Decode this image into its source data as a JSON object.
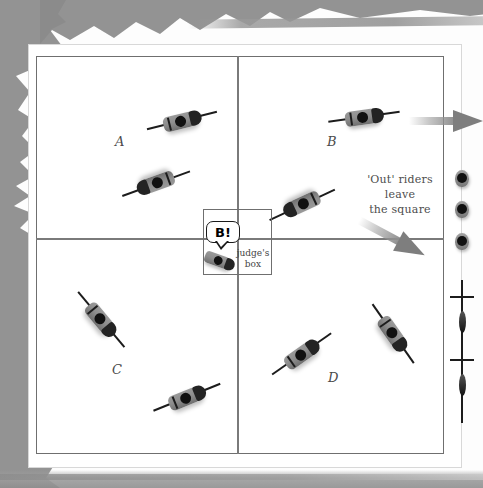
{
  "diagram": {
    "arena": {
      "quadrant_labels": [
        {
          "id": "A",
          "label": "A",
          "x": 115,
          "y": 134
        },
        {
          "id": "B",
          "label": "B",
          "x": 327,
          "y": 134
        },
        {
          "id": "C",
          "label": "C",
          "x": 112,
          "y": 362
        },
        {
          "id": "D",
          "label": "D",
          "x": 328,
          "y": 370
        }
      ]
    },
    "judges_box": {
      "label": "judge's box",
      "callout": "B!"
    },
    "annotations": [
      {
        "id": "out-riders",
        "line1": "'Out' riders leave",
        "line2": "the square"
      }
    ],
    "riders": [
      {
        "id": "rider-a1",
        "quadrant": "A",
        "x": 180,
        "y": 121,
        "angle": -14
      },
      {
        "id": "rider-a2",
        "quadrant": "A",
        "x": 158,
        "y": 183,
        "angle": 160
      },
      {
        "id": "rider-b1",
        "quadrant": "B",
        "x": 362,
        "y": 117,
        "angle": -8
      },
      {
        "id": "rider-b2",
        "quadrant": "B",
        "x": 304,
        "y": 204,
        "angle": 155
      },
      {
        "id": "rider-c1",
        "quadrant": "C",
        "x": 100,
        "y": 318,
        "angle": 50
      },
      {
        "id": "rider-c2",
        "quadrant": "C",
        "x": 185,
        "y": 398,
        "angle": -22
      },
      {
        "id": "rider-d1",
        "quadrant": "D",
        "x": 300,
        "y": 355,
        "angle": -35
      },
      {
        "id": "rider-d2",
        "quadrant": "D",
        "x": 392,
        "y": 332,
        "angle": 55
      },
      {
        "id": "rider-judge",
        "quadrant": "judges-box",
        "x": 218,
        "y": 260,
        "angle": 20
      }
    ],
    "waiting_riders": [
      {
        "id": "waiting-1",
        "x": 462,
        "y": 178
      },
      {
        "id": "waiting-2",
        "x": 462,
        "y": 209
      },
      {
        "id": "waiting-3",
        "x": 462,
        "y": 241
      }
    ],
    "lance_riders": [
      {
        "id": "lance-rider-1",
        "x": 462,
        "y": 320
      },
      {
        "id": "lance-rider-2",
        "x": 462,
        "y": 383
      }
    ],
    "arrows": [
      {
        "id": "arrow-exit-right",
        "x": 455,
        "y": 121,
        "angle": 0
      },
      {
        "id": "arrow-exit-diagonal",
        "x": 400,
        "y": 242,
        "angle": 28
      }
    ]
  },
  "colors": {
    "paper": "#ffffff",
    "torn_edge": "#8a8a8a",
    "arena_line": "#6f6f6f",
    "rider_body": "#8e8e8e",
    "rider_dark": "#1c1c1c",
    "arrow": "#7e7e7e",
    "text": "#4d4d4d"
  }
}
